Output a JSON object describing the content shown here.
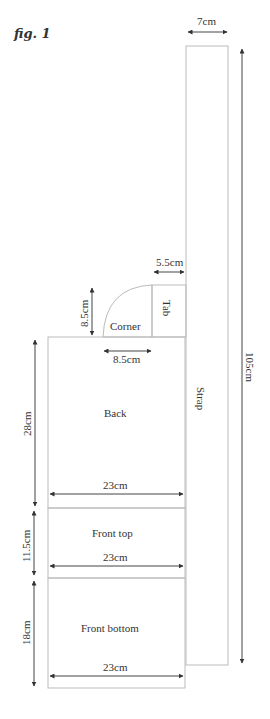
{
  "figure_label": "fig. 1",
  "pieces": {
    "strap": {
      "label": "Strap"
    },
    "tab": {
      "label": "Tab"
    },
    "corner": {
      "label": "Corner"
    },
    "back": {
      "label": "Back"
    },
    "front_top": {
      "label": "Front top"
    },
    "front_bottom": {
      "label": "Front bottom"
    }
  },
  "dimensions": {
    "strap_width": "7cm",
    "strap_length": "105cm",
    "tab_width": "5.5cm",
    "corner_height": "8.5cm",
    "corner_width": "8.5cm",
    "back_height": "28cm",
    "back_width": "23cm",
    "front_top_height": "11.5cm",
    "front_top_width": "23cm",
    "front_bottom_height": "18cm",
    "front_bottom_width": "23cm"
  }
}
